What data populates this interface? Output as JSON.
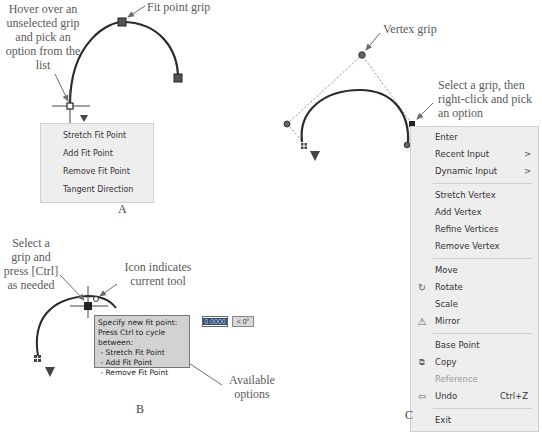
{
  "panels": {
    "A": {
      "label": "A",
      "callouts": {
        "hover": "Hover over an unselected grip and pick an option from the list",
        "fit_point_grip": "Fit point grip"
      },
      "menu": {
        "items": [
          {
            "label": "Stretch Fit Point"
          },
          {
            "label": "Add Fit Point"
          },
          {
            "label": "Remove Fit Point"
          },
          {
            "label": "Tangent Direction"
          }
        ]
      }
    },
    "B": {
      "label": "B",
      "callouts": {
        "select_grip": "Select a grip and press [Ctrl] as needed",
        "icon_indicates": "Icon indicates current tool",
        "available_options": "Available options"
      },
      "tooltip": {
        "line1": "Specify new fit point:",
        "line2": "Press Ctrl to cycle between:",
        "line3": " - Stretch Fit Point",
        "line4": " - Add Fit Point",
        "line5": " - Remove Fit Point"
      },
      "dynamic_input": {
        "value": "0.0000",
        "angle": "< 0°"
      }
    },
    "C": {
      "label": "C",
      "callouts": {
        "vertex_grip": "Vertex grip",
        "select_grip": "Select a grip, then right-click and pick an option"
      },
      "menu": {
        "items": [
          {
            "label": "Enter"
          },
          {
            "label": "Recent Input",
            "submenu": ">"
          },
          {
            "label": "Dynamic Input",
            "submenu": ">"
          },
          {
            "label": "Stretch Vertex"
          },
          {
            "label": "Add Vertex"
          },
          {
            "label": "Refine Vertices"
          },
          {
            "label": "Remove Vertex"
          },
          {
            "label": "Move"
          },
          {
            "label": "Rotate",
            "icon": "rotate-icon"
          },
          {
            "label": "Scale"
          },
          {
            "label": "Mirror",
            "icon": "mirror-icon"
          },
          {
            "label": "Base Point"
          },
          {
            "label": "Copy",
            "icon": "copy-icon"
          },
          {
            "label": "Reference",
            "disabled": true
          },
          {
            "label": "Undo",
            "icon": "undo-icon",
            "shortcut": "Ctrl+Z"
          },
          {
            "label": "Exit"
          }
        ]
      }
    }
  },
  "colors": {
    "menu_bg": "#eeeeee",
    "tooltip_bg": "#d2d2d2",
    "curve": "#2a2a2a",
    "grip": "#555555",
    "callout_text": "#5a5a5a"
  }
}
